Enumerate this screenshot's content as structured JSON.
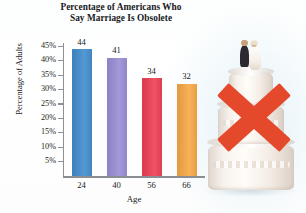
{
  "chart_data": {
    "type": "bar",
    "title": "Percentage of Americans Who Say Marriage Is Obsolete",
    "title_lines": [
      "Percentage of Americans Who",
      "Say Marriage Is Obsolete"
    ],
    "xlabel": "Age",
    "ylabel": "Percentage of Adults",
    "categories": [
      "24",
      "40",
      "56",
      "66"
    ],
    "values": [
      44,
      41,
      34,
      32
    ],
    "value_labels": [
      "44",
      "41",
      "34",
      "32"
    ],
    "bar_colors": [
      "#4a8fc9",
      "#9a8fd0",
      "#e8485c",
      "#f0a84e"
    ],
    "ylim": [
      0,
      46
    ],
    "yticks": [
      5,
      10,
      15,
      20,
      25,
      30,
      35,
      40,
      45
    ],
    "ytick_labels": [
      "5%",
      "10%",
      "15%",
      "20%",
      "25%",
      "30%",
      "35%",
      "40%",
      "45%"
    ],
    "grid": false,
    "legend": "none"
  },
  "artwork": {
    "caption": "wedding-cake-crossed-out",
    "cake_label": "tiered white wedding cake with bride and groom topper",
    "topper_label": "bride-and-groom figurine",
    "cross_label": "red X mark",
    "cross_color": "#e5492c",
    "cake_color": "#f7f1ea",
    "groom_color": "#2c2a30",
    "bride_color": "#fbf7f2"
  },
  "figure": {
    "background_color": "#ffffff",
    "axis_color": "#8d9196",
    "text_color": "#17191c"
  }
}
